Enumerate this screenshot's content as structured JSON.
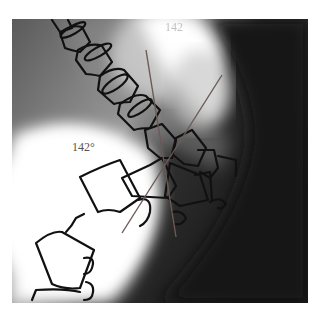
{
  "figure": {
    "type": "lateral spine radiograph with vertebral outlines",
    "angle_label_main": "142°",
    "angle_label_top": "142",
    "line_color": "#6b5a55",
    "outline_color": "#111111"
  }
}
